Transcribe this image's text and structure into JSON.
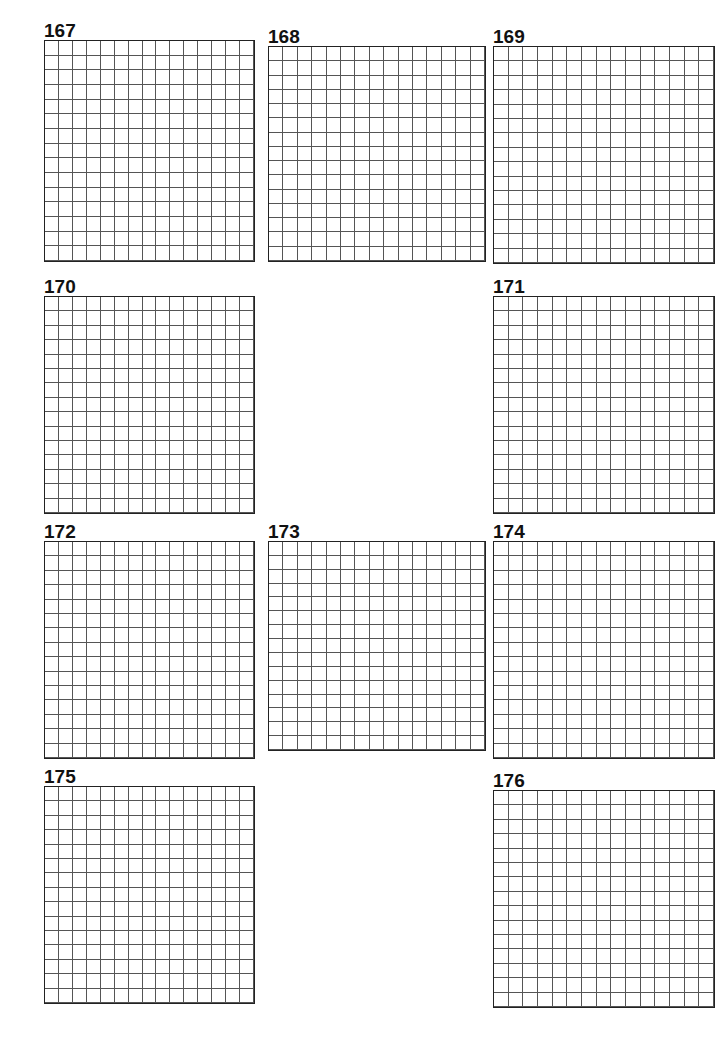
{
  "note": "Answer letters intentionally omitted; '#' = black square, '.' = open white square.",
  "puzzles": [
    {
      "number": "167",
      "rows": [
        "#####",
        "#####"
      ]
    }
  ]
}
